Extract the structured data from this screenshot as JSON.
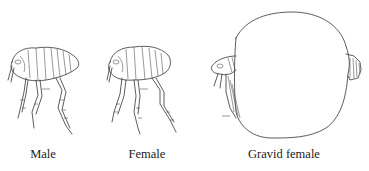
{
  "figure": {
    "panels": [
      {
        "id": "male",
        "label": "Male",
        "label_x": 43
      },
      {
        "id": "female",
        "label": "Female",
        "label_x": 147
      },
      {
        "id": "gravid-female",
        "label": "Gravid female",
        "label_x": 284
      }
    ],
    "colors": {
      "background": "#ffffff",
      "ink": "#333333"
    }
  }
}
